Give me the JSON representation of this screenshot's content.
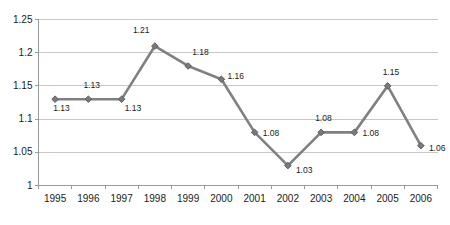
{
  "chart_data": {
    "type": "line",
    "title": "",
    "subtitle": "",
    "xlabel": "",
    "ylabel": "",
    "categories": [
      "1995",
      "1996",
      "1997",
      "1998",
      "1999",
      "2000",
      "2001",
      "2002",
      "2003",
      "2004",
      "2005",
      "2006"
    ],
    "values": [
      1.13,
      1.13,
      1.13,
      1.21,
      1.18,
      1.16,
      1.08,
      1.03,
      1.08,
      1.08,
      1.15,
      1.06
    ],
    "point_labels": [
      "1.13",
      "1.13",
      "1.13",
      "1.21",
      "1.18",
      "1.16",
      "1.08",
      "1.03",
      "1.08",
      "1.08",
      "1.15",
      "1.06"
    ],
    "ylim": [
      1,
      1.25
    ],
    "yticks": [
      1,
      1.05,
      1.1,
      1.15,
      1.2,
      1.25
    ],
    "ytick_labels": [
      "1",
      "1.05",
      "1.1",
      "1.15",
      "1.2",
      "1.25"
    ],
    "grid": "horizontal",
    "legend": "none",
    "series": [
      {
        "name": "",
        "values": [
          1.13,
          1.13,
          1.13,
          1.21,
          1.18,
          1.16,
          1.08,
          1.03,
          1.08,
          1.08,
          1.15,
          1.06
        ],
        "line_color": "#808080",
        "marker": "diamond",
        "marker_color": "#7a7a7a"
      }
    ],
    "colors": {
      "line": "#808080",
      "marker": "#7a7a7a",
      "grid": "#c8c8c8",
      "axis": "#9a9a9a",
      "text": "#1a1a1a",
      "background": "#ffffff"
    }
  },
  "label_offsets": [
    {
      "dx": -2,
      "dy": 9
    },
    {
      "dx": -5,
      "dy": -14
    },
    {
      "dx": 3,
      "dy": 9
    },
    {
      "dx": -22,
      "dy": -16
    },
    {
      "dx": 4,
      "dy": -14
    },
    {
      "dx": 6,
      "dy": -3
    },
    {
      "dx": 8,
      "dy": 1
    },
    {
      "dx": 8,
      "dy": 4
    },
    {
      "dx": -6,
      "dy": -14
    },
    {
      "dx": 8,
      "dy": 1
    },
    {
      "dx": -5,
      "dy": -14
    },
    {
      "dx": 8,
      "dy": 2
    }
  ]
}
